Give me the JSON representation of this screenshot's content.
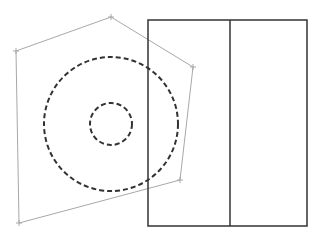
{
  "diagram": {
    "width": 318,
    "height": 239,
    "background": "#ffffff",
    "polygon": {
      "points": [
        [
          111,
          17
        ],
        [
          193,
          67
        ],
        [
          180,
          180
        ],
        [
          19,
          223
        ],
        [
          16,
          51
        ]
      ],
      "stroke": "#a8a8a8",
      "stroke_width": 1,
      "vertex_marker": "plus",
      "marker_size": 3
    },
    "circles": [
      {
        "name": "outer-dashed-circle",
        "cx": 111,
        "cy": 124,
        "r": 67,
        "stroke": "#333333",
        "stroke_width": 2,
        "dash": "5 3"
      },
      {
        "name": "inner-dashed-circle",
        "cx": 111,
        "cy": 124,
        "r": 21,
        "stroke": "#333333",
        "stroke_width": 2,
        "dash": "5 3"
      }
    ],
    "rectangle": {
      "x": 148,
      "y": 20,
      "width": 159,
      "height": 206,
      "stroke": "#333333",
      "stroke_width": 1.5,
      "divider_x": 230
    }
  }
}
